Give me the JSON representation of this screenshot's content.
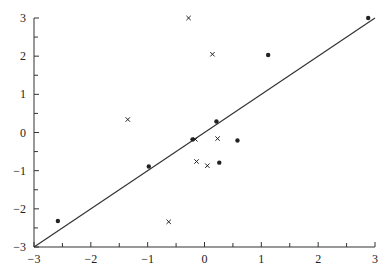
{
  "chart_data": {
    "type": "scatter",
    "title": "",
    "xlabel": "",
    "ylabel": "",
    "xlim": [
      -3,
      3
    ],
    "ylim": [
      -3,
      3
    ],
    "grid": false,
    "legend": null,
    "x_ticks": [
      "-3",
      "-2",
      "-1",
      "0",
      "1",
      "2",
      "3"
    ],
    "y_ticks": [
      "-3",
      "-2",
      "-1",
      "0",
      "1",
      "2",
      "3"
    ],
    "reference_line": {
      "label": "y = x",
      "from": [
        -3,
        -3
      ],
      "to": [
        3,
        3
      ]
    },
    "series": [
      {
        "name": "dots",
        "marker": "dot",
        "points": [
          {
            "x": -2.58,
            "y": -2.32
          },
          {
            "x": -0.98,
            "y": -0.89
          },
          {
            "x": -0.21,
            "y": -0.18
          },
          {
            "x": 0.21,
            "y": 0.29
          },
          {
            "x": 0.26,
            "y": -0.79
          },
          {
            "x": 0.58,
            "y": -0.21
          },
          {
            "x": 1.12,
            "y": 2.03
          },
          {
            "x": 2.88,
            "y": 3.0
          }
        ]
      },
      {
        "name": "crosses",
        "marker": "x",
        "points": [
          {
            "x": -1.35,
            "y": 0.34
          },
          {
            "x": -0.63,
            "y": -2.34
          },
          {
            "x": -0.28,
            "y": 3.0
          },
          {
            "x": -0.16,
            "y": -0.18
          },
          {
            "x": -0.14,
            "y": -0.76
          },
          {
            "x": 0.05,
            "y": -0.87
          },
          {
            "x": 0.14,
            "y": 2.05
          },
          {
            "x": 0.23,
            "y": -0.16
          }
        ]
      }
    ]
  },
  "colors": {
    "axis": "#333333",
    "line": "#333333",
    "marker": "#222222"
  }
}
